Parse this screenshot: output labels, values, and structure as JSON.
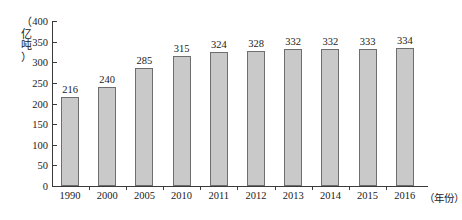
{
  "chart_data": {
    "type": "bar",
    "title": "",
    "subtitle": "",
    "xlabel": "（年份）",
    "ylabel": "（亿吨）",
    "categories": [
      "1990",
      "2000",
      "2005",
      "2010",
      "2011",
      "2012",
      "2013",
      "2014",
      "2015",
      "2016"
    ],
    "values": [
      216,
      240,
      285,
      315,
      324,
      328,
      332,
      332,
      333,
      334
    ],
    "ylim": [
      0,
      400
    ],
    "ytick_values": [
      0,
      50,
      100,
      150,
      200,
      250,
      300,
      350,
      400
    ],
    "ytick_labels": [
      "0",
      "50",
      "100",
      "150",
      "200",
      "250",
      "300",
      "350",
      "400"
    ],
    "grid": false,
    "legend": null,
    "data_labels_shown": true,
    "bar_fill_color": "#c9c9c9",
    "bar_border_color": "#6e6e6e",
    "axis_color": "#3a3a3a",
    "text_color": "#1a1a1a"
  },
  "y_axis_title_chars": [
    "（",
    "亿",
    "吨",
    "）"
  ]
}
